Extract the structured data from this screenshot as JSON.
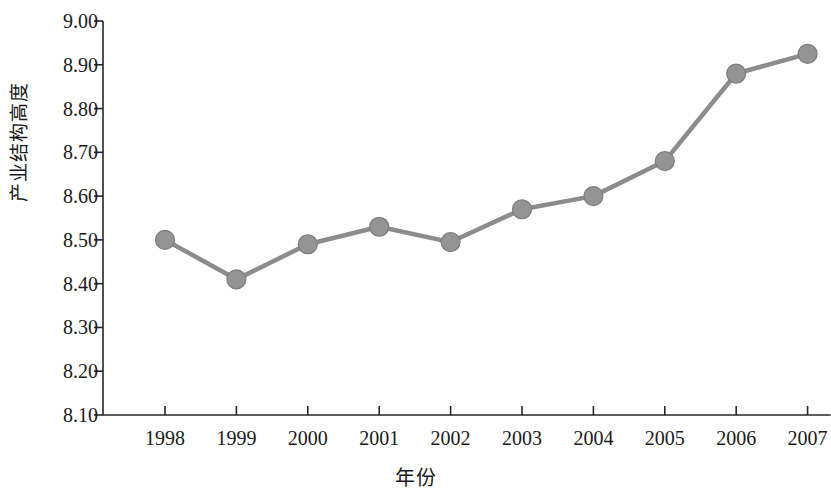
{
  "chart_data": {
    "type": "line",
    "title": "",
    "xlabel": "年份",
    "ylabel": "产业结构高度",
    "categories": [
      "1998",
      "1999",
      "2000",
      "2001",
      "2002",
      "2003",
      "2004",
      "2005",
      "2006",
      "2007"
    ],
    "values": [
      8.5,
      8.41,
      8.49,
      8.53,
      8.495,
      8.57,
      8.6,
      8.68,
      8.88,
      8.925
    ],
    "series": [
      {
        "name": "产业结构高度",
        "values": [
          8.5,
          8.41,
          8.49,
          8.53,
          8.495,
          8.57,
          8.6,
          8.68,
          8.88,
          8.925
        ]
      }
    ],
    "ylim": [
      8.1,
      9.0
    ],
    "ytick_step": 0.1,
    "ytick_labels": [
      "9.00",
      "8.90",
      "8.80",
      "8.70",
      "8.60",
      "8.50",
      "8.40",
      "8.30",
      "8.20",
      "8.10"
    ],
    "ytick_values": [
      9.0,
      8.9,
      8.8,
      8.7,
      8.6,
      8.5,
      8.4,
      8.3,
      8.2,
      8.1
    ],
    "xtick_labels": [
      "1998",
      "1999",
      "2000",
      "2001",
      "2002",
      "2003",
      "2004",
      "2005",
      "2006",
      "2007"
    ],
    "grid": false,
    "legend": "none",
    "colors": {
      "line": "#8c8c8c",
      "marker_fill": "#949494",
      "marker_stroke": "#7d7d7d",
      "axis": "#262626",
      "text": "#1a1a1a",
      "background": "#ffffff"
    }
  }
}
